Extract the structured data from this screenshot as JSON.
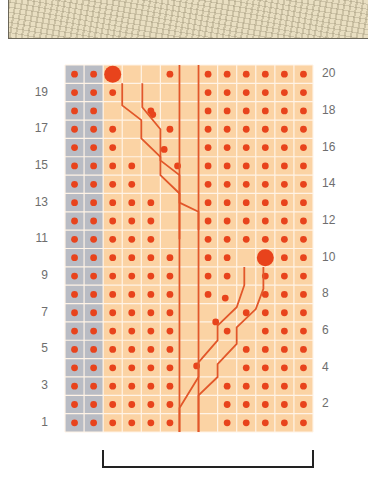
{
  "swatch": {
    "description": "knitted cable sample photo",
    "color": "#e9dfc2"
  },
  "chart": {
    "columns": 13,
    "rows": 20,
    "colors": {
      "gray_panel": "#b9bcc4",
      "orange_cell": "#fbd3a4",
      "grid_line": "#fff3e6",
      "dot": "#e8431c",
      "cable_line": "#e2572a",
      "bracket": "#222222"
    },
    "left_row_labels": [
      "19",
      "17",
      "15",
      "13",
      "11",
      "9",
      "7",
      "5",
      "3",
      "1"
    ],
    "right_row_labels": [
      "20",
      "18",
      "16",
      "14",
      "12",
      "10",
      "8",
      "6",
      "4",
      "2"
    ],
    "bobbles": [
      {
        "row": 20,
        "col": 3
      },
      {
        "row": 10,
        "col": 11
      }
    ],
    "repeat_bracket": {
      "from_col": 3,
      "to_col": 13
    }
  }
}
